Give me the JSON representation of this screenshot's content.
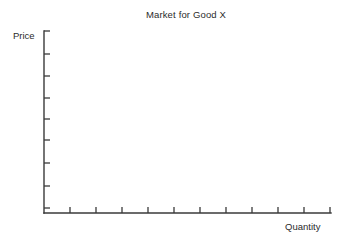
{
  "chart_data": {
    "type": "line",
    "title": "Market for Good X",
    "subtitle": "",
    "xlabel": "Quantity",
    "ylabel": "Price",
    "series": [],
    "x": [],
    "values": [],
    "annotations": [],
    "legend": {
      "entries": [],
      "position": "none"
    },
    "grid": false,
    "axes": {
      "x": {
        "label": "Quantity",
        "tick_labels": [],
        "tick_count": 12,
        "range_shown": "unlabeled",
        "direction": "left-to-right"
      },
      "y": {
        "label": "Price",
        "tick_labels": [],
        "tick_count": 9,
        "range_shown": "unlabeled",
        "direction": "bottom-to-top"
      }
    }
  },
  "figure": {
    "title": "Market for Good X",
    "ylabel": "Price",
    "xlabel": "Quantity",
    "background_color": "#ffffff",
    "axis_color": "#3a3a3a",
    "text_color": "#2b2b2b"
  },
  "geometry": {
    "origin_x": 44,
    "origin_y": 213,
    "y_axis_top": 31,
    "x_axis_right": 331,
    "y_tick_positions": [
      31,
      54,
      76,
      98,
      119,
      140,
      163,
      186,
      208
    ],
    "x_tick_positions": [
      70,
      96,
      122,
      148,
      174,
      200,
      226,
      252,
      278,
      304,
      330
    ],
    "y_tick_length": 6,
    "x_tick_length": 6
  }
}
